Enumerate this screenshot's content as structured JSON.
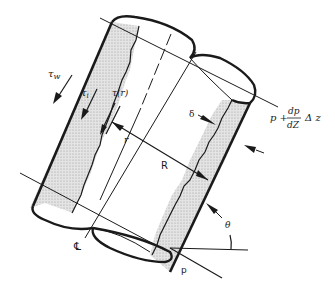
{
  "diagram": {
    "type": "annular film flow in inclined pipe",
    "labels": {
      "wall_shear": "τ",
      "wall_shear_sub": "w",
      "interfacial_shear": "τ",
      "interfacial_shear_sub": "i",
      "local_shear": "τ(r)",
      "radius_small": "r",
      "radius_pipe": "R",
      "film_thickness": "δ",
      "pressure_top_p": "p +",
      "pressure_top_num": "dp",
      "pressure_top_den": "dZ",
      "pressure_top_dz": "Δ z",
      "centerline": "℄",
      "pressure_bottom": "p",
      "angle": "θ"
    },
    "colors": {
      "stroke": "#1a1a1a",
      "film_fill": "#dcdcdc",
      "background": "#ffffff"
    }
  }
}
